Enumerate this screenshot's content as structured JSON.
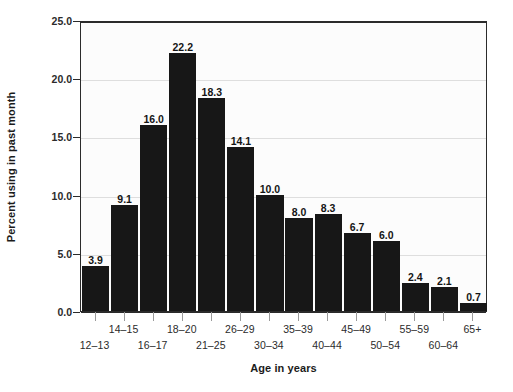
{
  "chart_data": {
    "type": "bar",
    "title": "",
    "xlabel": "Age in years",
    "ylabel": "Percent using in past month",
    "categories": [
      "12–13",
      "14–15",
      "16–17",
      "18–20",
      "21–25",
      "26–29",
      "30–34",
      "35–39",
      "40–44",
      "45–49",
      "50–54",
      "55–59",
      "60–64",
      "65+"
    ],
    "values": [
      3.9,
      9.1,
      16.0,
      22.2,
      18.3,
      14.1,
      10.0,
      8.0,
      8.3,
      6.7,
      6.0,
      2.4,
      2.1,
      0.7
    ],
    "value_labels": [
      "3.9",
      "9.1",
      "16.0",
      "22.2",
      "18.3",
      "14.1",
      "10.0",
      "8.0",
      "8.3",
      "6.7",
      "6.0",
      "2.4",
      "2.1",
      "0.7"
    ],
    "ylim": [
      0.0,
      25.0
    ],
    "ytick_values": [
      0.0,
      5.0,
      10.0,
      15.0,
      20.0,
      25.0
    ],
    "ytick_labels": [
      "0.0",
      "5.0",
      "10.0",
      "15.0",
      "20.0",
      "25.0"
    ],
    "grid": true,
    "grid_axis": "y",
    "legend": false,
    "legend_position": "none",
    "xtick_label_stagger": [
      "bottom",
      "top",
      "bottom",
      "top",
      "bottom",
      "top",
      "bottom",
      "top",
      "bottom",
      "top",
      "bottom",
      "top",
      "bottom",
      "top"
    ],
    "colors": {
      "bar": "#171717",
      "grid": "#dedede",
      "frame": "#2b2b2b",
      "plot_background": "#fcfcfc",
      "figure_background": "#ffffff",
      "text": "#1b1b1b"
    }
  }
}
